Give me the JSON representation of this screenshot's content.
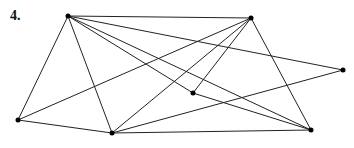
{
  "problem_label": "4.",
  "graph": {
    "vertices": [
      {
        "id": "A",
        "x": 68,
        "y": 16
      },
      {
        "id": "B",
        "x": 251,
        "y": 18
      },
      {
        "id": "C",
        "x": 343,
        "y": 70
      },
      {
        "id": "D",
        "x": 18,
        "y": 120
      },
      {
        "id": "E",
        "x": 112,
        "y": 133
      },
      {
        "id": "F",
        "x": 193,
        "y": 93
      },
      {
        "id": "G",
        "x": 311,
        "y": 130
      }
    ],
    "edges": [
      [
        "A",
        "B"
      ],
      [
        "A",
        "C"
      ],
      [
        "A",
        "D"
      ],
      [
        "A",
        "E"
      ],
      [
        "A",
        "F"
      ],
      [
        "A",
        "G"
      ],
      [
        "B",
        "D"
      ],
      [
        "B",
        "E"
      ],
      [
        "B",
        "F"
      ],
      [
        "B",
        "G"
      ],
      [
        "C",
        "E"
      ],
      [
        "D",
        "E"
      ],
      [
        "E",
        "G"
      ],
      [
        "F",
        "G"
      ]
    ],
    "line_color": "#222222",
    "vertex_color": "#000000"
  }
}
